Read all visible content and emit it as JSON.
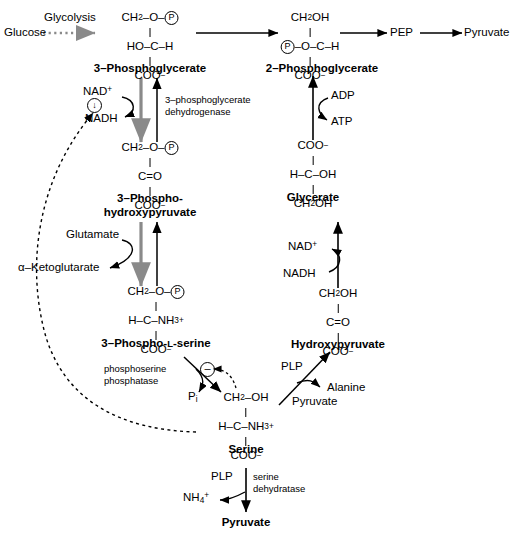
{
  "diagram": {
    "colors": {
      "line": "#000000",
      "gray_arrow": "#8a8a8a",
      "background": "#ffffff"
    },
    "metabolites": {
      "glucose": "Glucose",
      "pep": "PEP",
      "pyruvate_top": "Pyruvate",
      "pg3_name": "3–Phosphoglycerate",
      "pg2_name": "2–Phosphoglycerate",
      "php_name_line1": "3–Phospho-",
      "php_name_line2": "hydroxypyruvate",
      "glycerate_name": "Glycerate",
      "pser_name_1": "3–Phospho-",
      "pser_name_2": "L",
      "pser_name_3": "-serine",
      "hydroxypyruvate_name": "Hydroxypyruvate",
      "serine_name": "Serine",
      "pyruvate_bottom": "Pyruvate"
    },
    "structures": {
      "pg3": {
        "top": "CH₂–O–(P)",
        "mid_left": "HO–",
        "mid_c": "C",
        "mid_right": "–H",
        "bottom": "COO⁻"
      },
      "pg2": {
        "top": "CH₂OH",
        "mid_left": "(P)–O–",
        "mid_c": "C",
        "mid_right": "–H",
        "bottom": "COO⁻"
      },
      "php": {
        "top": "CH₂–O–(P)",
        "mid": "C=O",
        "bottom": "COO⁻"
      },
      "glycerate": {
        "top": "COO⁻",
        "mid_left": "H–",
        "mid_c": "C",
        "mid_right": "–OH",
        "bottom": "CH₂OH"
      },
      "pserine": {
        "top": "CH₂–O–(P)",
        "mid_left": "H–",
        "mid_c": "C",
        "mid_right": "–NH₃⁺",
        "bottom": "COO⁻"
      },
      "hydroxypyruvate": {
        "top": "CH₂OH",
        "mid": "C=O",
        "bottom": "COO⁻"
      },
      "serine": {
        "top": "CH₂–OH",
        "mid_left": "H–",
        "mid_c": "C",
        "mid_right": "–NH₃⁺",
        "bottom": "COO⁻"
      }
    },
    "enzymes": {
      "pgdh_line1": "3–phosphoglycerate",
      "pgdh_line2": "dehydrogenase",
      "phosphoserine_phosphatase_line1": "phosphoserine",
      "phosphoserine_phosphatase_line2": "phosphatase",
      "serine_dehydratase_line1": "serine",
      "serine_dehydratase_line2": "dehydratase"
    },
    "cofactors": {
      "glycolysis": "Glycolysis",
      "nad_plus_left": "NAD⁺",
      "nadh_left": "NADH",
      "nad_plus_right": "NAD⁺",
      "nadh_right": "NADH",
      "adp": "ADP",
      "atp": "ATP",
      "glutamate": "Glutamate",
      "alpha_ketoglutarate": "α–Ketoglutarate",
      "pi": "Pᵢ",
      "plp_alanine": "PLP",
      "alanine": "Alanine",
      "pyruvate_cofactor": "Pyruvate",
      "plp_serine_dehydratase": "PLP",
      "ammonium": "NH₄⁺"
    },
    "regulation": {
      "inhibition_symbol": "–",
      "feedback_symbol": "↓",
      "feedback_note": "dashed feedback line from serine to NADH-linked step"
    }
  }
}
